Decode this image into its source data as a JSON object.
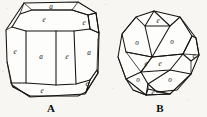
{
  "plate": {
    "background_color": "#f7f6f3",
    "ink_color": "#14120f",
    "width": 207,
    "height": 117
  },
  "figures": [
    {
      "id": "figure-a",
      "caption": "A",
      "caption_x": 51,
      "caption_y": 108,
      "description": "Crystal form A",
      "labels": [
        {
          "text": "a",
          "x": 51,
          "y": 7,
          "name": "face-label-a-top"
        },
        {
          "text": "e",
          "x": 44,
          "y": 20,
          "name": "face-label-a-upper-front"
        },
        {
          "text": "e",
          "x": 84,
          "y": 23,
          "name": "face-label-a-upper-right"
        },
        {
          "text": "e",
          "x": 15,
          "y": 52,
          "name": "face-label-a-left"
        },
        {
          "text": "a",
          "x": 41,
          "y": 57,
          "name": "face-label-a-center-left"
        },
        {
          "text": "e",
          "x": 67,
          "y": 57,
          "name": "face-label-a-center-right"
        },
        {
          "text": "a",
          "x": 89,
          "y": 53,
          "name": "face-label-a-right"
        },
        {
          "text": "e",
          "x": 87,
          "y": 84,
          "name": "face-label-a-lower-right"
        },
        {
          "text": "e",
          "x": 42,
          "y": 91,
          "name": "face-label-a-bottom"
        }
      ]
    },
    {
      "id": "figure-b",
      "caption": "B",
      "caption_x": 160,
      "caption_y": 108,
      "description": "Crystal form B",
      "labels": [
        {
          "text": "e",
          "x": 158,
          "y": 21,
          "name": "face-label-b-top"
        },
        {
          "text": "o",
          "x": 137,
          "y": 43,
          "name": "face-label-b-upper-left"
        },
        {
          "text": "o",
          "x": 172,
          "y": 42,
          "name": "face-label-b-upper-right"
        },
        {
          "text": "e",
          "x": 196,
          "y": 56,
          "name": "face-label-b-right"
        },
        {
          "text": "e",
          "x": 146,
          "y": 64,
          "name": "face-label-b-mid-left"
        },
        {
          "text": "e",
          "x": 159,
          "y": 64,
          "name": "face-label-b-mid-right"
        },
        {
          "text": "o",
          "x": 138,
          "y": 80,
          "name": "face-label-b-lower-left"
        },
        {
          "text": "o",
          "x": 170,
          "y": 80,
          "name": "face-label-b-lower-right"
        },
        {
          "text": "e",
          "x": 152,
          "y": 95,
          "name": "face-label-b-bottom"
        }
      ]
    }
  ]
}
